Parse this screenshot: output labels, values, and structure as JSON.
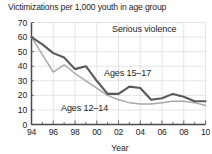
{
  "chart_data": {
    "type": "line",
    "title": "Victimizations per 1,000 youth in age group",
    "xlabel": "Year",
    "ylabel": "",
    "annotation": "Serious violence",
    "grid": true,
    "legend_position": "inline-labels",
    "xlim": [
      1994,
      2010
    ],
    "ylim": [
      0,
      70
    ],
    "yticks": [
      0,
      10,
      20,
      30,
      40,
      50,
      60,
      70
    ],
    "ytick_labels": [
      "0",
      "10",
      "20",
      "30",
      "40",
      "50",
      "60",
      "70"
    ],
    "x": [
      1994,
      1995,
      1996,
      1997,
      1998,
      1999,
      2000,
      2001,
      2002,
      2003,
      2004,
      2005,
      2006,
      2007,
      2008,
      2009,
      2010
    ],
    "xtick_labels": [
      "94",
      "",
      "96",
      "",
      "98",
      "",
      "00",
      "",
      "02",
      "",
      "04",
      "",
      "06",
      "",
      "08",
      "",
      "10"
    ],
    "xtick_labels_shown": [
      "94",
      "96",
      "98",
      "00",
      "02",
      "04",
      "06",
      "08",
      "10"
    ],
    "series": [
      {
        "name": "Ages 15–17",
        "color": "#595959",
        "values": [
          60,
          55,
          49,
          46,
          38,
          40,
          30,
          21,
          21,
          26,
          25,
          17,
          18,
          21,
          19,
          16,
          16
        ]
      },
      {
        "name": "Ages 12–14",
        "color": "#a8a8a8",
        "values": [
          60,
          48,
          36,
          41,
          35,
          30,
          25,
          20,
          17,
          15,
          14,
          14,
          15,
          16,
          16,
          15,
          13
        ]
      }
    ],
    "colors": {
      "grid": "#d8d8d8",
      "axis": "#4a4a4a",
      "text": "#1d1d1d",
      "background": "#ffffff"
    }
  },
  "labels": {
    "series_15_17": "Ages 15–17",
    "series_12_14": "Ages 12–14",
    "annotation_serious": "Serious violence"
  }
}
